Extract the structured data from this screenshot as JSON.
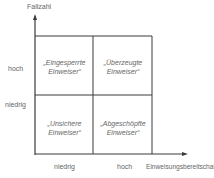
{
  "diagram": {
    "y_axis": {
      "label": "Fallzahl",
      "ticks": [
        "hoch",
        "niedrig"
      ]
    },
    "x_axis": {
      "label": "Einweisungsbereitschaft",
      "ticks": [
        "niedrig",
        "hoch"
      ]
    },
    "quadrants": {
      "top_left": {
        "line1": "„Eingesperrte",
        "line2": "Einweiser“"
      },
      "top_right": {
        "line1": "„Überzeugte",
        "line2": "Einweiser“"
      },
      "bottom_left": {
        "line1": "„Unsichere",
        "line2": "Einweiser“"
      },
      "bottom_right": {
        "line1": "„Abgeschöpfte",
        "line2": "Einweiser“"
      }
    },
    "colors": {
      "line": "#3a3a3a",
      "text": "#666666"
    }
  }
}
